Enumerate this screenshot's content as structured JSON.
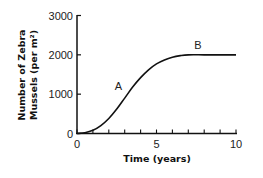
{
  "chart_data": {
    "type": "line",
    "title": "",
    "xlabel": "Time (years)",
    "ylabel_line1": "Number of Zebra",
    "ylabel_line2": "Mussels (per m²)",
    "xlim": [
      0,
      10
    ],
    "ylim": [
      0,
      3000
    ],
    "x_ticks": [
      0,
      5,
      10
    ],
    "x_minor_ticks": [
      1,
      2,
      3,
      4,
      6,
      7,
      8,
      9
    ],
    "y_ticks": [
      0,
      1000,
      2000,
      3000
    ],
    "grid": false,
    "legend": null,
    "series": [
      {
        "name": "Zebra mussel population",
        "x": [
          0,
          0.5,
          1,
          1.5,
          2,
          2.5,
          3,
          3.5,
          4,
          4.5,
          5,
          5.5,
          6,
          6.5,
          7,
          8,
          9,
          10
        ],
        "y": [
          0,
          20,
          80,
          200,
          380,
          620,
          900,
          1180,
          1420,
          1620,
          1770,
          1870,
          1940,
          1980,
          2000,
          2000,
          2000,
          2000
        ]
      }
    ],
    "annotations": [
      {
        "text": "A",
        "x": 2.6,
        "y": 1100
      },
      {
        "text": "B",
        "x": 7.6,
        "y": 2150
      }
    ]
  }
}
